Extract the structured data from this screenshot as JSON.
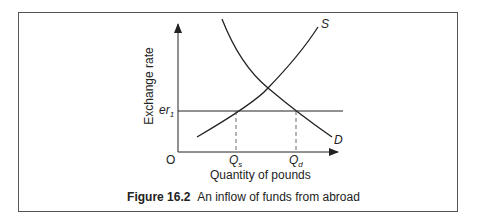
{
  "figure": {
    "number_label": "Figure 16.2",
    "caption_text": "An inflow of funds from abroad"
  },
  "axes": {
    "y_label": "Exchange rate",
    "x_label": "Quantity of pounds",
    "origin_label": "O"
  },
  "curves": {
    "supply_label": "S",
    "demand_label": "D"
  },
  "markers": {
    "price_level": {
      "base": "er",
      "sub": "1"
    },
    "q_supplied": {
      "base": "Q",
      "sub": "s"
    },
    "q_demanded": {
      "base": "Q",
      "sub": "d"
    }
  },
  "colors": {
    "line": "#222222",
    "frame": "#555555"
  }
}
